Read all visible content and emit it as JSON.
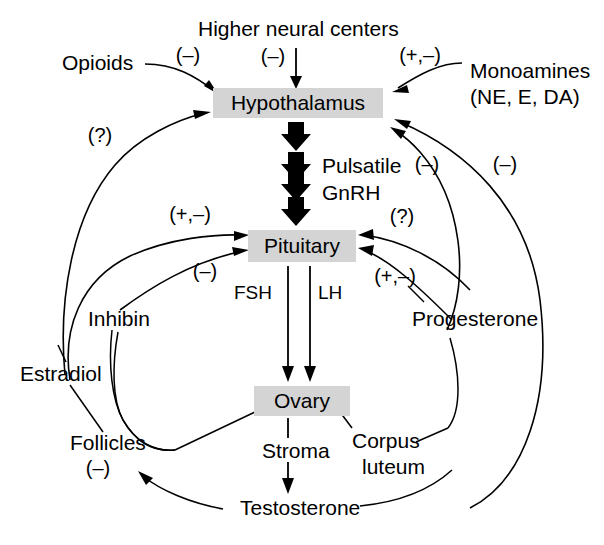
{
  "figure": {
    "background_color": "#ffffff",
    "box_fill_color": "#d4d4d4",
    "line_color": "#000000"
  },
  "nodes": {
    "hypothalamus": "Hypothalamus",
    "pituitary": "Pituitary",
    "ovary": "Ovary"
  },
  "labels": {
    "higher_neural_centers": "Higher neural centers",
    "opioids": "Opioids",
    "monoamines": "Monoamines",
    "monoamines_detail": "(NE, E, DA)",
    "pulsatile": "Pulsatile",
    "gnrh": "GnRH",
    "fsh": "FSH",
    "lh": "LH",
    "inhibin": "Inhibin",
    "estradiol": "Estradiol",
    "progesterone": "Progesterone",
    "follicles": "Follicles",
    "stroma": "Stroma",
    "corpus": "Corpus",
    "luteum": "luteum",
    "testosterone": "Testosterone"
  },
  "signs": {
    "opioids_to_hypothalamus": "(–)",
    "higher_centers_to_hypothalamus": "(–)",
    "monoamines_to_hypothalamus": "(+,–)",
    "estradiol_to_hypothalamus": "(?)",
    "progesterone_to_hypothalamus": "(–)",
    "testosterone_to_hypothalamus": "(–)",
    "estradiol_to_pituitary": "(+,–)",
    "inhibin_to_pituitary": "(–)",
    "progesterone_to_pituitary_upper": "(?)",
    "progesterone_to_pituitary_lower": "(+,–)",
    "follicles": "(–)"
  }
}
